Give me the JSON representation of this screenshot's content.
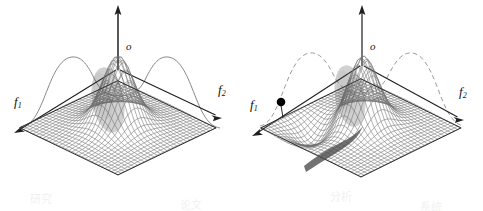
{
  "figure": {
    "background_color": "#ffffff",
    "ink_color": "#1a1a1a",
    "width": 483,
    "height": 211
  },
  "panels": [
    {
      "id": "panel-left",
      "name": "left-surface-plot",
      "vertical_axis_label": "o",
      "left_axis_label": "f",
      "left_axis_sub": "1",
      "right_axis_label": "f",
      "right_axis_sub": "2",
      "silhouette_curve_style": "solid",
      "has_marker_dot": false,
      "surface": "single central gaussian peak on flat rhombus mesh",
      "mesh_color": "#6f6f6f",
      "curve_color": "#707070"
    },
    {
      "id": "panel-right",
      "name": "right-surface-plot",
      "vertical_axis_label": "o",
      "left_axis_label": "f",
      "left_axis_sub": "1",
      "right_axis_label": "f",
      "right_axis_sub": "2",
      "silhouette_curve_style": "dashed",
      "has_marker_dot": true,
      "marker_dot_color": "#000000",
      "surface": "gaussian peak with dark shadowed trough valley on rhombus mesh",
      "mesh_color": "#6f6f6f",
      "curve_color": "#8a8a8a"
    }
  ],
  "chart_data": {
    "type": "surface",
    "title": "",
    "xlabel": "f1",
    "ylabel": "f2",
    "zlabel": "o",
    "grid": true,
    "legend": "none",
    "panels": [
      {
        "name": "left",
        "label": "unimodal response surface",
        "profile_curve": {
          "style": "solid",
          "type": "line",
          "description": "bimodal silhouette profile behind surface",
          "x": [
            0,
            10,
            20,
            30,
            40,
            50,
            60,
            70,
            80,
            90,
            100
          ],
          "y": [
            2,
            10,
            34,
            58,
            50,
            40,
            50,
            58,
            34,
            10,
            2
          ]
        },
        "surface_peaks": [
          {
            "u": 0.5,
            "v": 0.5,
            "height": 1.0
          }
        ]
      },
      {
        "name": "right",
        "label": "response surface with shadowed trough",
        "profile_curve": {
          "style": "dashed",
          "type": "line",
          "description": "bimodal silhouette profile behind surface",
          "x": [
            0,
            10,
            20,
            30,
            40,
            50,
            60,
            70,
            80,
            90,
            100
          ],
          "y": [
            2,
            12,
            40,
            60,
            48,
            36,
            48,
            60,
            40,
            12,
            2
          ]
        },
        "surface_peaks": [
          {
            "u": 0.5,
            "v": 0.5,
            "height": 1.0
          }
        ],
        "surface_troughs": [
          {
            "u": 0.42,
            "v": 0.82,
            "depth": 0.35
          }
        ],
        "marker": {
          "label": "",
          "u": 0.12,
          "v": 0.3,
          "shape": "filled-circle"
        }
      }
    ]
  },
  "bleed_through": [
    {
      "text": "研究",
      "x": 30,
      "y": 190
    },
    {
      "text": "论文",
      "x": 180,
      "y": 196
    },
    {
      "text": "分析",
      "x": 330,
      "y": 188
    },
    {
      "text": "系统",
      "x": 420,
      "y": 198
    }
  ]
}
